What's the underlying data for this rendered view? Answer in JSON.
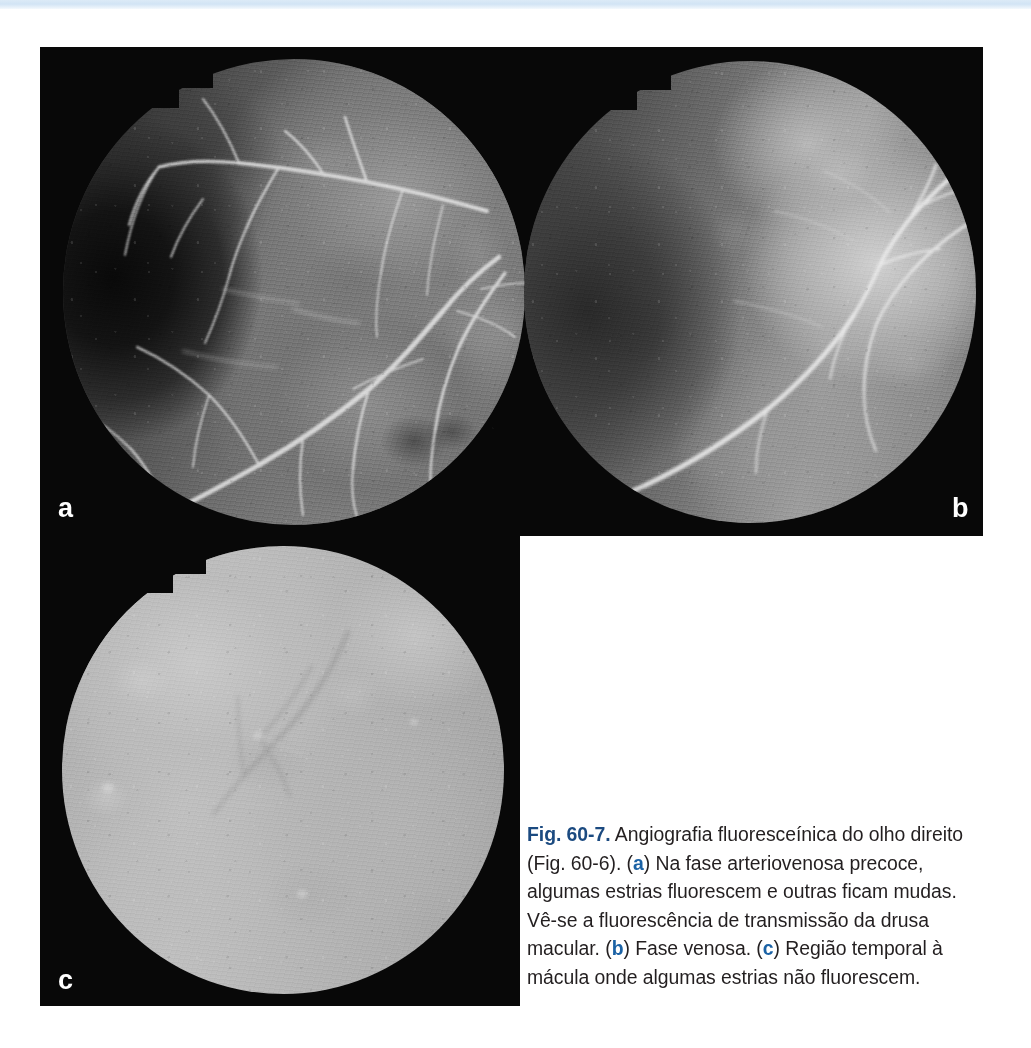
{
  "figure": {
    "number_label": "Fig. 60-7.",
    "caption_parts": {
      "intro": " Angiografia fluoresceínica do olho direito (Fig. 60-6). (",
      "ref_a": "a",
      "text_a": ") Na fase arteriovenosa precoce, algumas estrias fluorescem e outras ficam mudas. Vê-se a fluorescência de transmissão da drusa macular. (",
      "ref_b": "b",
      "text_b": ") Fase venosa. (",
      "ref_c": "c",
      "text_c": ") Região temporal à mácula onde algumas estrias não fluorescem."
    },
    "caption_full": "Fig. 60-7. Angiografia fluoresceínica do olho direito (Fig. 60-6). (a) Na fase arteriovenosa precoce, algumas estrias fluorescem e outras ficam mudas. Vê-se a fluorescência de transmissão da drusa macular. (b) Fase venosa. (c) Região temporal à mácula onde algumas estrias não fluorescem."
  },
  "panels": [
    {
      "letter": "a",
      "description": "Angiografia fluoresceínica - fase arteriovenosa precoce, olho direito",
      "position": "top-left"
    },
    {
      "letter": "b",
      "description": "Angiografia fluoresceínica - fase venosa",
      "position": "top-right"
    },
    {
      "letter": "c",
      "description": "Região temporal à mácula, estrias não fluorescentes",
      "position": "bottom-left"
    }
  ],
  "colors": {
    "page_background": "#ffffff",
    "plate_background": "#080808",
    "panel_letter": "#ffffff",
    "caption_text": "#231f20",
    "fig_label": "#1b4a80",
    "panel_reference": "#1b62a5",
    "top_strip": "#d2e4f5"
  }
}
